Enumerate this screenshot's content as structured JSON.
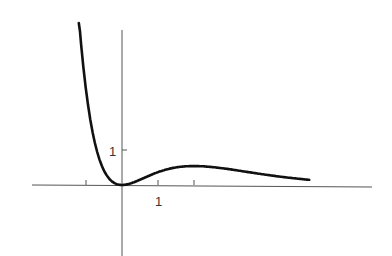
{
  "chart_data": {
    "type": "line",
    "title": "",
    "xlabel": "",
    "ylabel": "",
    "function": "x^2 e^(-x)",
    "x_tick_labels": [
      "1"
    ],
    "y_tick_labels": [
      "1"
    ],
    "x_ticks": [
      -1,
      1,
      2
    ],
    "y_ticks": [
      1
    ],
    "xlim": [
      -2.5,
      7
    ],
    "ylim": [
      -2,
      4.4
    ],
    "grid": false,
    "legend": null,
    "series": [
      {
        "name": "f(x)",
        "x": [
          -1.2,
          -1.0,
          -0.8,
          -0.6,
          -0.4,
          -0.2,
          0,
          0.25,
          0.5,
          0.75,
          1.0,
          1.5,
          2.0,
          2.5,
          3.0,
          3.5,
          4.0,
          4.5,
          5.2
        ],
        "y": [
          4.78,
          2.72,
          1.42,
          0.66,
          0.24,
          0.05,
          0,
          0.05,
          0.15,
          0.27,
          0.37,
          0.5,
          0.54,
          0.51,
          0.45,
          0.37,
          0.29,
          0.22,
          0.15
        ]
      }
    ],
    "colors": {
      "curve": "#111111",
      "axes": "#444444"
    }
  }
}
